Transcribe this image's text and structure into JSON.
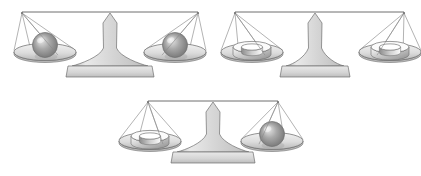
{
  "canvas": {
    "width": 421,
    "height": 176,
    "background": "#ffffff",
    "title": "Balance scale comparison diagram"
  },
  "palette": {
    "outline": "#6f6f6f",
    "string": "#8a8a8a",
    "column_light": "#e9e9e9",
    "column_mid": "#d4d4d4",
    "column_dark": "#bdbdbd",
    "pan_light": "#f2f2f2",
    "pan_mid": "#dcdcdc",
    "pan_dark": "#b8b8b8",
    "sphere_light": "#efefef",
    "sphere_mid": "#a9a9a9",
    "sphere_dark": "#6b6b6b",
    "ring_light": "#fbfbfb",
    "ring_mid": "#cfcfcf",
    "ring_dark": "#8c8c8c"
  },
  "diagram": {
    "type": "balance-scales",
    "object_kinds": [
      "sphere",
      "ring"
    ],
    "scale_count": 3,
    "all_balanced": true
  },
  "scales": [
    {
      "id": "scale-1",
      "name": "top-left-scale",
      "label": "Scale 1",
      "state": "balanced",
      "fulcrum_x": 110,
      "beam_y": 12,
      "beam_left_x": 22,
      "beam_right_x": 198,
      "base_y": 66,
      "base_half_width": 42,
      "left_pan": {
        "object": "sphere",
        "pan_cx": 45,
        "pan_cy": 52,
        "label": "sphere"
      },
      "right_pan": {
        "object": "sphere",
        "pan_cx": 175,
        "pan_cy": 52,
        "label": "sphere"
      }
    },
    {
      "id": "scale-2",
      "name": "top-right-scale",
      "label": "Scale 2",
      "state": "balanced",
      "fulcrum_x": 315,
      "beam_y": 12,
      "beam_left_x": 235,
      "beam_right_x": 404,
      "base_y": 66,
      "base_half_width": 33,
      "left_pan": {
        "object": "ring",
        "pan_cx": 252,
        "pan_cy": 52,
        "label": "ring"
      },
      "right_pan": {
        "object": "ring",
        "pan_cx": 390,
        "pan_cy": 52,
        "label": "ring"
      }
    },
    {
      "id": "scale-3",
      "name": "bottom-center-scale",
      "label": "Scale 3",
      "state": "balanced",
      "fulcrum_x": 213,
      "beam_y": 101,
      "beam_left_x": 148,
      "beam_right_x": 278,
      "base_y": 152,
      "base_half_width": 40,
      "left_pan": {
        "object": "ring",
        "pan_cx": 150,
        "pan_cy": 141,
        "label": "ring"
      },
      "right_pan": {
        "object": "sphere",
        "pan_cx": 272,
        "pan_cy": 141,
        "label": "sphere"
      }
    }
  ]
}
